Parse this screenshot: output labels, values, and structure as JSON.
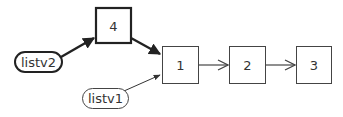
{
  "diagram": {
    "type": "linked-list",
    "nodes": [
      {
        "id": "n4",
        "label": "4",
        "emphasis": "bold"
      },
      {
        "id": "n1",
        "label": "1",
        "emphasis": "normal"
      },
      {
        "id": "n2",
        "label": "2",
        "emphasis": "normal"
      },
      {
        "id": "n3",
        "label": "3",
        "emphasis": "normal"
      }
    ],
    "pointers": [
      {
        "id": "listv2",
        "label": "listv2",
        "emphasis": "bold",
        "points_to": "4"
      },
      {
        "id": "listv1",
        "label": "listv1",
        "emphasis": "normal",
        "points_to": "1"
      }
    ],
    "edges": [
      {
        "from": "listv2",
        "to": "4",
        "emphasis": "bold"
      },
      {
        "from": "4",
        "to": "1",
        "emphasis": "bold"
      },
      {
        "from": "listv1",
        "to": "1",
        "emphasis": "normal"
      },
      {
        "from": "1",
        "to": "2",
        "emphasis": "normal"
      },
      {
        "from": "2",
        "to": "3",
        "emphasis": "normal"
      }
    ],
    "colors": {
      "stroke": "#333333",
      "background": "#ffffff"
    }
  }
}
